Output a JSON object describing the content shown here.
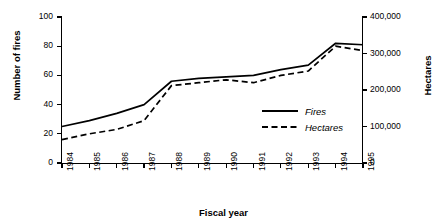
{
  "chart_data": {
    "type": "line",
    "title": "",
    "xlabel": "Fiscal year",
    "ylabel": "Number of fires",
    "y2label": "Hectares",
    "categories": [
      "1984",
      "1985",
      "1986",
      "1987",
      "1988",
      "1989",
      "1990",
      "1991",
      "1992",
      "1993",
      "1994",
      "1995"
    ],
    "x": [
      1984,
      1985,
      1986,
      1987,
      1988,
      1989,
      1990,
      1991,
      1992,
      1993,
      1994,
      1995
    ],
    "ylim": [
      0,
      100
    ],
    "y2lim": [
      0,
      400000
    ],
    "yticks": [
      0,
      20,
      40,
      60,
      80,
      100
    ],
    "ytick_labels": [
      "0",
      "20",
      "40",
      "60",
      "80",
      "100"
    ],
    "y2ticks": [
      0,
      100000,
      200000,
      300000,
      400000
    ],
    "y2tick_labels": [
      "0",
      "100,000",
      "200,000",
      "300,000",
      "400,000"
    ],
    "grid": false,
    "legend_position": "center-right-inside",
    "series": [
      {
        "name": "Fires",
        "axis": "left",
        "style": "solid",
        "color": "#000000",
        "values": [
          25,
          29,
          34,
          40,
          56,
          58,
          59,
          60,
          64,
          67,
          82,
          81
        ]
      },
      {
        "name": "Hectares",
        "axis": "right",
        "style": "dashed",
        "color": "#000000",
        "values": [
          64000,
          80000,
          92000,
          116000,
          212000,
          220000,
          228000,
          220000,
          240000,
          252000,
          320000,
          308000
        ],
        "values_in_left_units": [
          16,
          20,
          23,
          29,
          53,
          55,
          57,
          55,
          60,
          63,
          80,
          77
        ]
      }
    ]
  },
  "legend": {
    "items": [
      {
        "label": "Fires",
        "style": "solid"
      },
      {
        "label": "Hectares",
        "style": "dashed"
      }
    ]
  }
}
